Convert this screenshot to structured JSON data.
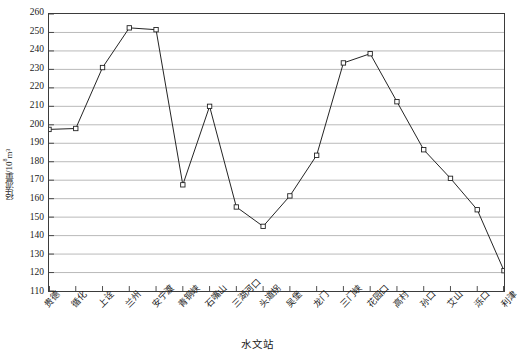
{
  "chart_data": {
    "type": "line",
    "title": "",
    "xlabel": "水文站",
    "ylabel": "径流量/10⁸m³",
    "ylabel_main": "径流量/10",
    "ylabel_exp": "8",
    "ylabel_unit": "m³",
    "categories": [
      "贵德",
      "循化",
      "上诠",
      "兰州",
      "安宁渡",
      "青铜峡",
      "石嘴山",
      "三湖河口",
      "头道拐",
      "吴堡",
      "龙门",
      "三门峡",
      "花园口",
      "高村",
      "孙口",
      "艾山",
      "泺口",
      "利津"
    ],
    "values": [
      197.5,
      198,
      231,
      252.5,
      251.5,
      167.5,
      210,
      155.5,
      145,
      161.5,
      183.5,
      233.5,
      238.5,
      212.5,
      186.5,
      171,
      154,
      121
    ],
    "ylim": [
      110,
      260
    ],
    "ytick_values": [
      110,
      120,
      130,
      140,
      150,
      160,
      170,
      180,
      190,
      200,
      210,
      220,
      230,
      240,
      250,
      260
    ],
    "grid": "horizontal",
    "legend": "none",
    "marker": "open-square",
    "line_color": "#222222",
    "grid_color": "#a8a8a8",
    "axis_color": "#3b3b3b"
  }
}
